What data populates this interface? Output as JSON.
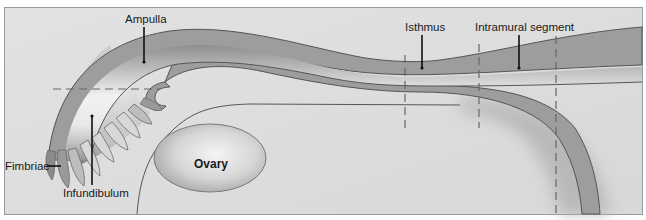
{
  "figure": {
    "colors": {
      "background": "#dedede",
      "frame": "#9a9a9a",
      "tube_wall": "#9d9d9d",
      "lumen_light": "#ececec",
      "lumen_dark": "#8e8e8e",
      "ovary_center": "#f0f0f0",
      "ovary_edge": "#a6a6a6",
      "outline": "#555555",
      "leader": "#111111",
      "dashed": "#666666"
    },
    "labels": {
      "ampulla": "Ampulla",
      "isthmus": "Isthmus",
      "intramural": "Intramural segment",
      "fimbriae": "Fimbriae",
      "infundibulum": "Infundibulum",
      "ovary": "Ovary"
    },
    "label_positions": {
      "ampulla": {
        "x": 143,
        "y": 23
      },
      "isthmus": {
        "x": 408,
        "y": 31
      },
      "intramural": {
        "x": 475,
        "y": 31
      },
      "fimbriae": {
        "x": 4,
        "y": 168
      },
      "infundibulum": {
        "x": 63,
        "y": 197
      },
      "ovary": {
        "x": 183,
        "y": 164
      }
    },
    "section_dividers_x": [
      405,
      479,
      556
    ],
    "horizontal_divider": {
      "x1": 53,
      "x2": 160,
      "y": 89
    }
  }
}
